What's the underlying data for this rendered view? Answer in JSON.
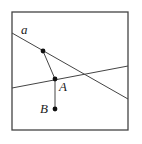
{
  "diagram": {
    "width": 142,
    "height": 144,
    "frame": {
      "x": 12,
      "y": 12,
      "width": 116,
      "height": 118,
      "stroke": "#444444"
    },
    "line_color": "#444444",
    "point_color": "#111111",
    "lines": [
      {
        "name": "line-a",
        "x1": 12,
        "y1": 33,
        "x2": 128,
        "y2": 99
      },
      {
        "name": "line-second",
        "x1": 12,
        "y1": 88,
        "x2": 128,
        "y2": 66
      }
    ],
    "segments": [
      {
        "name": "segment-p-to-A",
        "x1": 43,
        "y1": 51,
        "x2": 55,
        "y2": 79
      },
      {
        "name": "segment-A-to-B",
        "x1": 55,
        "y1": 79,
        "x2": 55,
        "y2": 109
      }
    ],
    "points": [
      {
        "name": "point-on-a",
        "cx": 43,
        "cy": 51
      },
      {
        "name": "point-A",
        "cx": 55,
        "cy": 79
      },
      {
        "name": "point-B",
        "cx": 55,
        "cy": 109
      }
    ],
    "labels": {
      "line_a": {
        "text": "a",
        "x": 21,
        "y": 34
      },
      "point_A": {
        "text": "A",
        "x": 59,
        "y": 91
      },
      "point_B": {
        "text": "B",
        "x": 40,
        "y": 113
      }
    }
  }
}
